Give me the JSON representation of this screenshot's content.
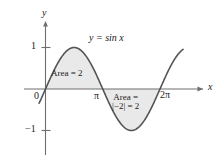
{
  "figure": {
    "colors": {
      "curve": "#555555",
      "axis": "#6e6e6e",
      "fill": "#e9e9e9",
      "fill_stroke": "#9a9a9a",
      "text": "#1a1a1a"
    },
    "axes": {
      "x_axis_label": "x",
      "y_axis_label": "y",
      "origin_label": "0",
      "x_ticks": [
        {
          "label": "π",
          "value": 3.14159
        },
        {
          "label": "2π",
          "value": 6.28318
        }
      ],
      "y_ticks": [
        {
          "label": "1",
          "value": 1
        },
        {
          "label": "−1",
          "value": -1
        }
      ]
    },
    "annotations": {
      "curve_equation": "y = sin x",
      "area_positive": "Area = 2",
      "area_negative_line1": "Area =",
      "area_negative_line2": "|−2| = 2"
    }
  },
  "chart_data": {
    "type": "line",
    "title": "",
    "xlabel": "x",
    "ylabel": "y",
    "xlim": [
      -0.35,
      7.55
    ],
    "ylim": [
      -1.45,
      1.45
    ],
    "grid": false,
    "legend": null,
    "series": [
      {
        "name": "y = sin x",
        "equation": "sin(x)",
        "x": [
          -0.25,
          0,
          0.3927,
          0.7854,
          1.1781,
          1.5708,
          1.9635,
          2.3562,
          2.7489,
          3.14159,
          3.5343,
          3.927,
          4.3197,
          4.7124,
          5.1051,
          5.4978,
          5.8905,
          6.28318,
          6.6759,
          7.0686,
          7.35
        ],
        "y": [
          -0.2474,
          0,
          0.3827,
          0.7071,
          0.9239,
          1.0,
          0.9239,
          0.7071,
          0.3827,
          0.0,
          -0.3827,
          -0.7071,
          -0.9239,
          -1.0,
          -0.9239,
          -0.7071,
          -0.3827,
          0.0,
          0.3827,
          0.7071,
          0.8371
        ]
      }
    ],
    "shaded_regions": [
      {
        "label": "Area = 2",
        "x_start": 0,
        "x_end": 3.14159,
        "sign": "positive",
        "signed_value": 2,
        "area_value": 2
      },
      {
        "label": "Area = |−2| = 2",
        "x_start": 3.14159,
        "x_end": 6.28318,
        "sign": "negative",
        "signed_value": -2,
        "area_value": 2
      }
    ]
  }
}
